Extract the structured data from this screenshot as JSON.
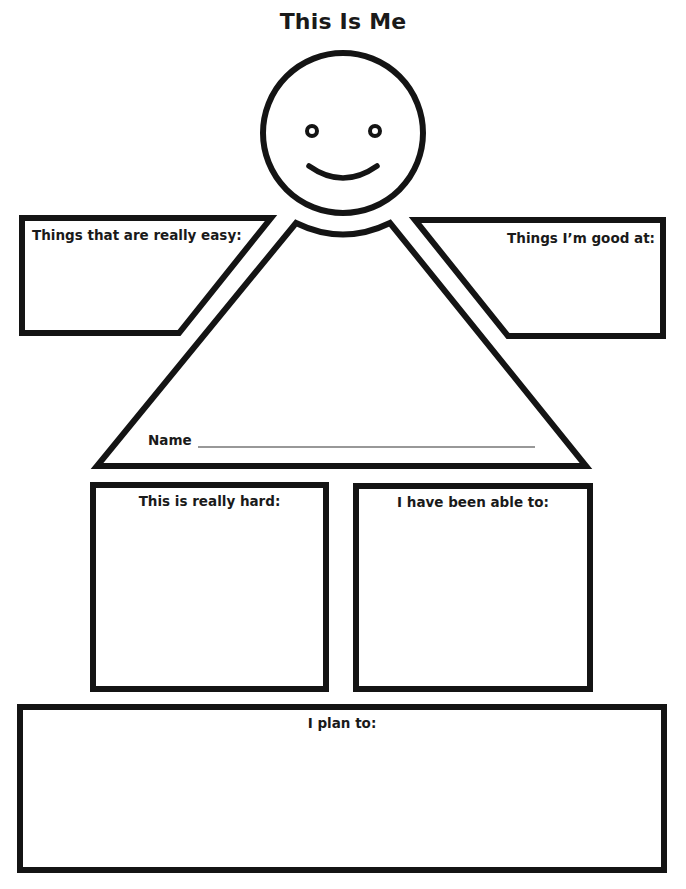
{
  "worksheet": {
    "title": "This Is Me",
    "colors": {
      "ink": "#141414",
      "paper": "#ffffff"
    },
    "figure": {
      "head": "smiley-face",
      "body": "triangle"
    },
    "sections": {
      "easy": {
        "label": "Things that are really easy:",
        "value": ""
      },
      "good_at": {
        "label": "Things I’m good at:",
        "value": ""
      },
      "name": {
        "label": "Name",
        "value": ""
      },
      "hard": {
        "label": "This is really hard:",
        "value": ""
      },
      "able_to": {
        "label": "I have been able to:",
        "value": ""
      },
      "plan": {
        "label": "I plan to:",
        "value": ""
      }
    }
  }
}
